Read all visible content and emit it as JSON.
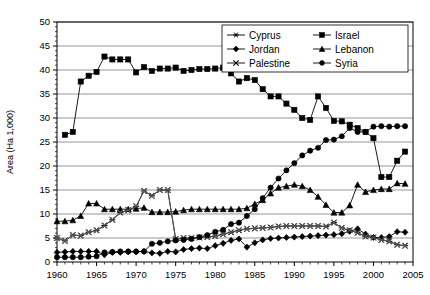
{
  "chart_data": {
    "type": "line",
    "title": "",
    "xlabel": "",
    "ylabel": "Area (Ha 1,000)",
    "xlim": [
      1960,
      2005
    ],
    "ylim": [
      0,
      50
    ],
    "xticks": [
      1960,
      1965,
      1970,
      1975,
      1980,
      1985,
      1990,
      1995,
      2000,
      2005
    ],
    "yticks": [
      0,
      5,
      10,
      15,
      20,
      25,
      30,
      35,
      40,
      45,
      50
    ],
    "xtick_labels": [
      "1960",
      "1965",
      "1970",
      "1975",
      "1980",
      "1985",
      "1990",
      "1995",
      "2000",
      "2005"
    ],
    "ytick_labels": [
      "0",
      "5",
      "10",
      "15",
      "20",
      "25",
      "30",
      "35",
      "40",
      "45",
      "50"
    ],
    "x_minor_tick_step": 1,
    "grid": "horizontal",
    "legend_position": "top-right",
    "legend_columns": 2,
    "series": [
      {
        "name": "Cyprus",
        "marker": "asterisk",
        "color": "#000000",
        "x": [
          1960,
          1961,
          1962,
          1963,
          1964,
          1965,
          1966,
          1967,
          1968,
          1969,
          1970,
          1971,
          1972,
          1973,
          1974,
          1975,
          1976,
          1977,
          1978,
          1979,
          1980,
          1981,
          1982,
          1983,
          1984,
          1985,
          1986,
          1987,
          1988,
          1989,
          1990,
          1991,
          1992,
          1993,
          1994,
          1995,
          1996,
          1997,
          1998,
          1999,
          2000,
          2001,
          2002,
          2003,
          2004
        ],
        "y": [
          5.0,
          4.4,
          5.6,
          5.5,
          6.2,
          6.6,
          7.6,
          8.8,
          10.3,
          10.8,
          11.6,
          14.8,
          13.8,
          15.0,
          15.0,
          4.8,
          5.0,
          5.0,
          5.1,
          5.2,
          5.4,
          5.8,
          6.2,
          6.6,
          6.9,
          7.0,
          7.1,
          7.2,
          7.4,
          7.5,
          7.5,
          7.5,
          7.5,
          7.5,
          7.4,
          8.2,
          7.1,
          6.6,
          6.1,
          5.3,
          5.1,
          4.6,
          4.3,
          3.6,
          3.4
        ]
      },
      {
        "name": "Israel",
        "marker": "square",
        "color": "#000000",
        "x": [
          1961,
          1962,
          1963,
          1964,
          1965,
          1966,
          1967,
          1968,
          1969,
          1970,
          1971,
          1972,
          1973,
          1974,
          1975,
          1976,
          1977,
          1978,
          1979,
          1980,
          1981,
          1982,
          1983,
          1984,
          1985,
          1986,
          1987,
          1988,
          1989,
          1990,
          1991,
          1992,
          1993,
          1994,
          1995,
          1996,
          1997,
          1998,
          1999,
          2000,
          2001,
          2002,
          2003,
          2004
        ],
        "y": [
          26.5,
          27.1,
          37.6,
          38.8,
          39.6,
          42.8,
          42.2,
          42.2,
          42.2,
          39.5,
          40.6,
          39.8,
          40.3,
          40.3,
          40.5,
          39.8,
          40.0,
          40.2,
          40.2,
          40.3,
          40.5,
          39.3,
          37.6,
          38.3,
          37.9,
          36.0,
          34.5,
          34.5,
          33.0,
          31.7,
          30.0,
          29.6,
          34.5,
          32.1,
          29.4,
          29.3,
          28.6,
          27.9,
          27.1,
          25.8,
          17.7,
          17.7,
          21.1,
          23.0
        ]
      },
      {
        "name": "Jordan",
        "marker": "diamond",
        "color": "#000000",
        "x": [
          1960,
          1961,
          1962,
          1963,
          1964,
          1965,
          1966,
          1967,
          1968,
          1969,
          1970,
          1971,
          1972,
          1973,
          1974,
          1975,
          1976,
          1977,
          1978,
          1979,
          1980,
          1981,
          1982,
          1983,
          1984,
          1985,
          1986,
          1987,
          1988,
          1989,
          1990,
          1991,
          1992,
          1993,
          1994,
          1995,
          1996,
          1997,
          1998,
          1999,
          2000,
          2001,
          2002,
          2003,
          2004
        ],
        "y": [
          2.0,
          2.1,
          2.2,
          2.2,
          2.2,
          2.2,
          1.5,
          2.0,
          2.0,
          2.1,
          2.1,
          2.2,
          1.9,
          1.8,
          2.2,
          2.1,
          2.6,
          2.8,
          2.9,
          2.8,
          3.4,
          3.9,
          4.5,
          4.8,
          3.1,
          4.0,
          4.6,
          4.9,
          5.0,
          5.1,
          5.2,
          5.3,
          5.4,
          5.5,
          5.6,
          5.7,
          5.9,
          6.4,
          6.9,
          5.8,
          5.1,
          5.1,
          5.3,
          6.3,
          6.2
        ]
      },
      {
        "name": "Lebanon",
        "marker": "triangle",
        "color": "#000000",
        "x": [
          1960,
          1961,
          1962,
          1963,
          1964,
          1965,
          1966,
          1967,
          1968,
          1969,
          1970,
          1971,
          1972,
          1973,
          1974,
          1975,
          1976,
          1977,
          1978,
          1979,
          1980,
          1981,
          1982,
          1983,
          1984,
          1985,
          1986,
          1987,
          1988,
          1989,
          1990,
          1991,
          1992,
          1993,
          1994,
          1995,
          1996,
          1997,
          1998,
          1999,
          2000,
          2001,
          2002,
          2003,
          2004
        ],
        "y": [
          8.5,
          8.5,
          8.7,
          9.6,
          12.2,
          12.2,
          11.0,
          11.0,
          11.0,
          11.0,
          11.1,
          11.3,
          10.4,
          10.4,
          10.4,
          10.5,
          10.8,
          11.0,
          11.0,
          11.0,
          11.0,
          11.0,
          11.0,
          11.0,
          11.2,
          12.1,
          12.9,
          14.3,
          15.5,
          15.8,
          16.1,
          15.8,
          15.0,
          13.6,
          11.9,
          10.3,
          10.3,
          11.8,
          16.1,
          14.6,
          15.0,
          15.2,
          15.2,
          16.4,
          16.3
        ]
      },
      {
        "name": "Palestine",
        "marker": "x",
        "color": "#555555",
        "x": [
          1960,
          1961,
          1962,
          1963,
          1964,
          1965,
          1966,
          1967,
          1968,
          1969,
          1970,
          1971,
          1972,
          1973,
          1974,
          1975,
          1976,
          1977,
          1978,
          1979,
          1980,
          1981,
          1982,
          1983,
          1984,
          1985,
          1986,
          1987,
          1988,
          1989,
          1990,
          1991,
          1992,
          1993,
          1994,
          1995,
          1996,
          1997,
          1998,
          1999,
          2000,
          2001,
          2002,
          2003,
          2004
        ],
        "y": [
          5.0,
          4.4,
          5.6,
          5.5,
          6.2,
          6.6,
          7.6,
          8.8,
          10.3,
          10.8,
          11.6,
          14.8,
          13.8,
          15.0,
          15.0,
          4.8,
          5.0,
          5.0,
          5.1,
          5.2,
          5.4,
          5.8,
          6.2,
          6.6,
          6.9,
          7.0,
          7.1,
          7.2,
          7.4,
          7.5,
          7.5,
          7.5,
          7.5,
          7.5,
          7.4,
          8.2,
          7.1,
          6.6,
          6.1,
          5.3,
          5.1,
          4.6,
          4.3,
          3.6,
          3.4
        ]
      },
      {
        "name": "Syria",
        "marker": "circle",
        "color": "#000000",
        "x": [
          1960,
          1961,
          1962,
          1963,
          1964,
          1965,
          1966,
          1967,
          1968,
          1969,
          1970,
          1971,
          1972,
          1973,
          1974,
          1975,
          1976,
          1977,
          1978,
          1979,
          1980,
          1981,
          1982,
          1983,
          1984,
          1985,
          1986,
          1987,
          1988,
          1989,
          1990,
          1991,
          1992,
          1993,
          1994,
          1995,
          1996,
          1997,
          1998,
          1999,
          2000,
          2001,
          2002,
          2003,
          2004
        ],
        "y": [
          1.0,
          1.0,
          1.0,
          1.0,
          1.1,
          1.2,
          2.0,
          2.1,
          2.2,
          2.2,
          2.2,
          2.2,
          3.8,
          4.0,
          4.3,
          4.5,
          4.6,
          4.8,
          5.2,
          5.6,
          6.3,
          6.7,
          7.9,
          8.2,
          9.6,
          11.0,
          13.3,
          15.5,
          17.4,
          19.1,
          20.6,
          22.2,
          23.2,
          23.8,
          25.4,
          25.5,
          26.2,
          27.9,
          27.1,
          27.1,
          28.2,
          28.3,
          28.2,
          28.3,
          28.3
        ]
      }
    ]
  },
  "legend": {
    "entries": [
      {
        "label": "Cyprus",
        "marker": "asterisk"
      },
      {
        "label": "Israel",
        "marker": "square"
      },
      {
        "label": "Jordan",
        "marker": "diamond"
      },
      {
        "label": "Lebanon",
        "marker": "triangle"
      },
      {
        "label": "Palestine",
        "marker": "x"
      },
      {
        "label": "Syria",
        "marker": "circle"
      }
    ]
  }
}
